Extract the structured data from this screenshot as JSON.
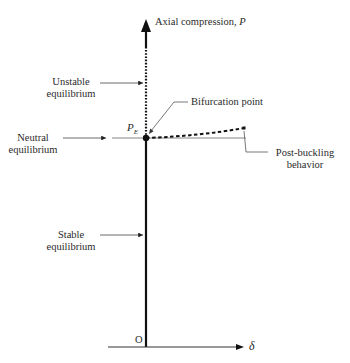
{
  "diagram": {
    "type": "buckling-equilibrium-diagram",
    "axes": {
      "y_label": "Axial compression,",
      "y_symbol": "P",
      "x_symbol": "δ",
      "origin": "O"
    },
    "critical_load": {
      "symbol": "P",
      "subscript": "E"
    },
    "annotations": {
      "unstable": [
        "Unstable",
        "equilibrium"
      ],
      "neutral": [
        "Neutral",
        "equilibrium"
      ],
      "stable": [
        "Stable",
        "equilibrium"
      ],
      "bifurcation": "Bifurcation point",
      "post_buckling": [
        "Post-buckling",
        "behavior"
      ]
    },
    "colors": {
      "line": "#111111",
      "thin_line": "#555555",
      "text": "#2a2a2a"
    }
  }
}
